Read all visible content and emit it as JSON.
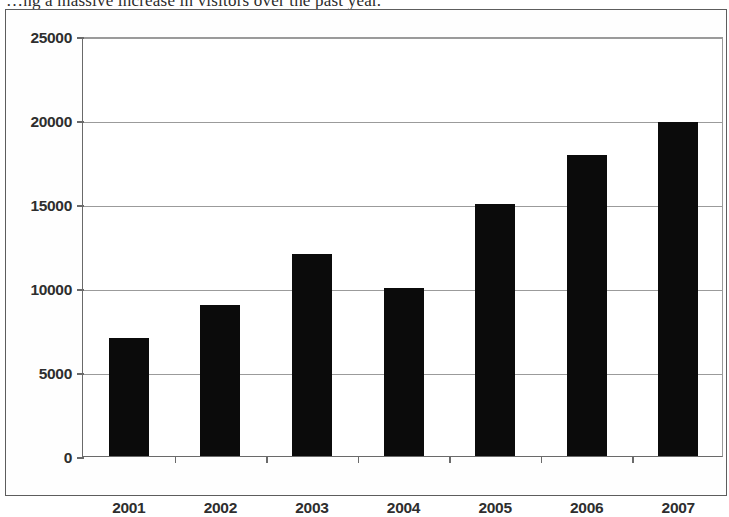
{
  "page": {
    "cropped_heading_text": "…ng a massive increase in visitors over the past year."
  },
  "figure": {
    "plot_background": "#ffffff",
    "bar_color": "#0b0b0b",
    "grid_color": "#9b9b9b",
    "axis_color": "#6a6a6a",
    "border_color": "#5d5d5d"
  },
  "chart_data": {
    "type": "bar",
    "title": "",
    "xlabel": "",
    "ylabel": "",
    "categories": [
      "2001",
      "2002",
      "2003",
      "2004",
      "2005",
      "2006",
      "2007"
    ],
    "values": [
      7000,
      9000,
      12000,
      10000,
      15000,
      17900,
      19900
    ],
    "series": [
      {
        "name": "Visitors",
        "values": [
          7000,
          9000,
          12000,
          10000,
          15000,
          17900,
          19900
        ]
      }
    ],
    "ylim": [
      0,
      25000
    ],
    "yticks": [
      0,
      5000,
      10000,
      15000,
      20000,
      25000
    ],
    "ytick_labels": [
      "0",
      "5000",
      "10000",
      "15000",
      "20000",
      "25000"
    ],
    "grid": true,
    "grid_axis": "y",
    "legend": false,
    "legend_position": "none"
  }
}
